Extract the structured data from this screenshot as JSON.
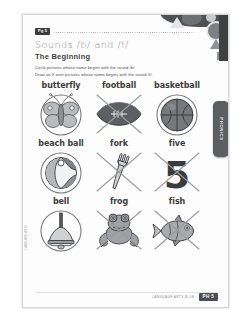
{
  "page": {
    "badge": "Pg 5",
    "title": "Sounds /b/ and /f/",
    "subtitle": "The Beginning",
    "instructions": [
      "Circle pictures whose name begins with the sound /b/.",
      "Draw an X over pictures whose name begins with the sound /f/."
    ],
    "side_tab_label": "PHONICS",
    "margin_note": "LANGUAGE ARTS"
  },
  "items": [
    {
      "label": "butterfly",
      "icon": "butterfly-icon",
      "mark": "circle"
    },
    {
      "label": "football",
      "icon": "football-icon",
      "mark": "cross"
    },
    {
      "label": "basketball",
      "icon": "basketball-icon",
      "mark": "circle"
    },
    {
      "label": "beach ball",
      "icon": "beach-ball-icon",
      "mark": "circle"
    },
    {
      "label": "fork",
      "icon": "fork-icon",
      "mark": "cross"
    },
    {
      "label": "five",
      "icon": "five-icon",
      "mark": "cross"
    },
    {
      "label": "bell",
      "icon": "bell-icon",
      "mark": "circle"
    },
    {
      "label": "frog",
      "icon": "frog-icon",
      "mark": "cross"
    },
    {
      "label": "fish",
      "icon": "fish-icon",
      "mark": "cross"
    }
  ],
  "footer": {
    "source": "LANGUAGE ARTS BLUE",
    "page_badge": "PH 5"
  },
  "colors": {
    "ink": "#3d3e40",
    "muted": "#8d8f91",
    "mark": "#77797c",
    "tab": "#5b5d60"
  }
}
